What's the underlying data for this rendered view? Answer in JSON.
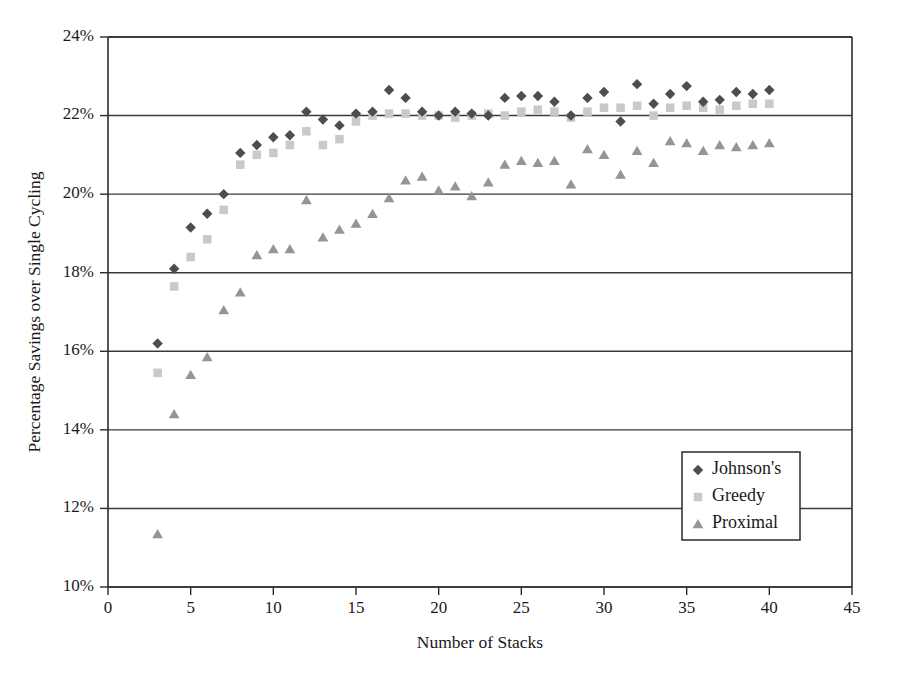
{
  "chart_data": {
    "type": "scatter",
    "title": "",
    "xlabel": "Number of Stacks",
    "ylabel": "Percentage Savings over Single Cycling",
    "xlim": [
      0,
      45
    ],
    "ylim": [
      10,
      24
    ],
    "xticks": [
      0,
      5,
      10,
      15,
      20,
      25,
      30,
      35,
      40,
      45
    ],
    "xtick_labels": [
      "0",
      "5",
      "10",
      "15",
      "20",
      "25",
      "30",
      "35",
      "40",
      "45"
    ],
    "yticks": [
      10,
      12,
      14,
      16,
      18,
      20,
      22,
      24
    ],
    "ytick_labels": [
      "10%",
      "12%",
      "14%",
      "16%",
      "18%",
      "20%",
      "22%",
      "24%"
    ],
    "grid": "horizontal",
    "legend_position": "inside-lower-right",
    "series": [
      {
        "name": "Johnson's",
        "marker": "diamond",
        "color": "#4d4d4d",
        "x": [
          3,
          4,
          5,
          6,
          7,
          8,
          9,
          10,
          11,
          12,
          13,
          14,
          15,
          16,
          17,
          18,
          19,
          20,
          21,
          22,
          23,
          24,
          25,
          26,
          27,
          28,
          29,
          30,
          31,
          32,
          33,
          34,
          35,
          36,
          37,
          38,
          39,
          40
        ],
        "y": [
          16.2,
          18.1,
          19.15,
          19.5,
          20.0,
          21.05,
          21.25,
          21.45,
          21.5,
          22.1,
          21.9,
          21.75,
          22.05,
          22.1,
          22.65,
          22.45,
          22.1,
          22.0,
          22.1,
          22.05,
          22.0,
          22.45,
          22.5,
          22.5,
          22.35,
          22.0,
          22.45,
          22.6,
          21.85,
          22.8,
          22.3,
          22.55,
          22.75,
          22.35,
          22.4,
          22.6,
          22.55,
          22.65
        ]
      },
      {
        "name": "Greedy",
        "marker": "square",
        "color": "#c9c9c9",
        "x": [
          3,
          4,
          5,
          6,
          7,
          8,
          9,
          10,
          11,
          12,
          13,
          14,
          15,
          16,
          17,
          18,
          19,
          20,
          21,
          22,
          23,
          24,
          25,
          26,
          27,
          28,
          29,
          30,
          31,
          32,
          33,
          34,
          35,
          36,
          37,
          38,
          39,
          40
        ],
        "y": [
          15.45,
          17.65,
          18.4,
          18.85,
          19.6,
          20.75,
          21.0,
          21.05,
          21.25,
          21.6,
          21.25,
          21.4,
          21.85,
          22.0,
          22.05,
          22.05,
          22.0,
          22.0,
          21.95,
          22.0,
          22.05,
          22.0,
          22.1,
          22.15,
          22.1,
          21.95,
          22.1,
          22.2,
          22.2,
          22.25,
          22.0,
          22.2,
          22.25,
          22.2,
          22.15,
          22.25,
          22.3,
          22.3
        ]
      },
      {
        "name": "Proximal",
        "marker": "triangle",
        "color": "#959595",
        "x": [
          3,
          4,
          5,
          6,
          7,
          8,
          9,
          10,
          11,
          12,
          13,
          14,
          15,
          16,
          17,
          18,
          19,
          20,
          21,
          22,
          23,
          24,
          25,
          26,
          27,
          28,
          29,
          30,
          31,
          32,
          33,
          34,
          35,
          36,
          37,
          38,
          39,
          40
        ],
        "y": [
          11.35,
          14.4,
          15.4,
          15.85,
          17.05,
          17.5,
          18.45,
          18.6,
          18.6,
          19.85,
          18.9,
          19.1,
          19.25,
          19.5,
          19.9,
          20.35,
          20.45,
          20.1,
          20.2,
          19.95,
          20.3,
          20.75,
          20.85,
          20.8,
          20.85,
          20.25,
          21.15,
          21.0,
          20.5,
          21.1,
          20.8,
          21.35,
          21.3,
          21.1,
          21.25,
          21.2,
          21.25,
          21.3
        ]
      }
    ]
  },
  "legend": {
    "entries": [
      {
        "label": "Johnson's",
        "marker": "diamond",
        "color": "#4d4d4d"
      },
      {
        "label": "Greedy",
        "marker": "square",
        "color": "#c9c9c9"
      },
      {
        "label": "Proximal",
        "marker": "triangle",
        "color": "#959595"
      }
    ]
  },
  "colors": {
    "axis": "#2b2b2b",
    "grid": "#3a3a3a",
    "background": "#ffffff",
    "text": "#1a1a1a"
  }
}
